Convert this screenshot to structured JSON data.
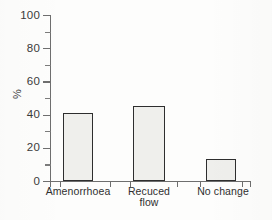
{
  "chart_data": {
    "type": "bar",
    "title": "",
    "xlabel": "",
    "ylabel": "%",
    "categories": [
      "Amenorrhoea",
      "Recuced flow",
      "No change"
    ],
    "category_lines": [
      [
        "Amenorrhoea"
      ],
      [
        "Recuced",
        "flow"
      ],
      [
        "No change"
      ]
    ],
    "values": [
      41,
      45,
      13
    ],
    "ylim": [
      0,
      100
    ],
    "y_major_ticks": [
      0,
      20,
      40,
      60,
      80,
      100
    ],
    "y_minor_ticks": [
      10,
      30,
      50,
      70,
      90
    ],
    "y_tick_labels": [
      "0",
      "20",
      "40",
      "60",
      "80",
      "100"
    ],
    "grid": false,
    "legend": null,
    "bar_fill_color": "#efefec",
    "bar_edge_color": "#2e2e2e",
    "axis_color": "#6e6e6e",
    "text_color": "#2f2f2f"
  }
}
